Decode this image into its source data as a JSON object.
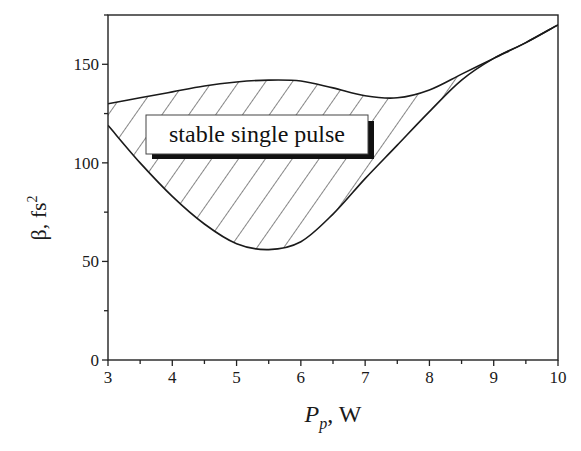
{
  "chart_data": {
    "type": "area",
    "title": "",
    "xlabel": "P_p, W",
    "xlabel_main": "P",
    "xlabel_sub": "p",
    "xlabel_unit": ", W",
    "ylabel": "β, fs²",
    "ylabel_main": "β, fs",
    "ylabel_sup": "2",
    "xlim": [
      3,
      10
    ],
    "ylim": [
      0,
      175
    ],
    "xticks": [
      3,
      4,
      5,
      6,
      7,
      8,
      9,
      10
    ],
    "xtick_labels": [
      "3",
      "4",
      "5",
      "6",
      "7",
      "8",
      "9",
      "10"
    ],
    "yticks": [
      0,
      50,
      100,
      150
    ],
    "ytick_labels": [
      "0",
      "50",
      "100",
      "150"
    ],
    "grid": false,
    "legend": null,
    "annotations": [
      {
        "text": "stable single pulse",
        "x": 5.6,
        "y": 112,
        "boxed": true,
        "shadow": true
      }
    ],
    "series": [
      {
        "name": "upper boundary",
        "x": [
          3.0,
          3.5,
          4.0,
          4.5,
          5.0,
          5.5,
          6.0,
          6.5,
          7.0,
          7.5,
          8.0,
          8.5,
          9.0,
          9.5,
          10.0
        ],
        "values": [
          130,
          133,
          136,
          139,
          141,
          142,
          141.5,
          138,
          134,
          133,
          137,
          145,
          153,
          161,
          170
        ]
      },
      {
        "name": "lower boundary",
        "x": [
          3.0,
          3.5,
          4.0,
          4.5,
          5.0,
          5.5,
          6.0,
          6.5,
          7.0,
          7.5,
          8.0,
          8.5,
          9.0,
          9.5,
          10.0
        ],
        "values": [
          119,
          100,
          83,
          69,
          59,
          56,
          60,
          74,
          92,
          109,
          126,
          142,
          153,
          161,
          170
        ]
      }
    ],
    "hatched_region": "between upper and lower boundary (stable single pulse)"
  }
}
